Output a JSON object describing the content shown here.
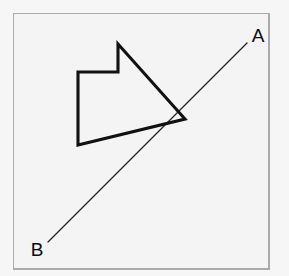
{
  "figure": {
    "background_color": "#f6f6f6",
    "grid": {
      "origin_x": 13,
      "origin_y": 13,
      "cell_size": 28.4,
      "columns": 9,
      "rows": 9,
      "line_color": "#b9b9bd",
      "border_color": "#a9a9ae",
      "fill_color": "#f4f4f4",
      "visible": true
    },
    "labels": [
      {
        "id": "A",
        "text": "A",
        "x": 258,
        "y": 42,
        "anchor": "middle"
      },
      {
        "id": "B",
        "text": "B",
        "x": 37,
        "y": 256,
        "anchor": "middle"
      }
    ],
    "line_ab": {
      "name": "line-ab",
      "color": "#222222",
      "stroke_width": 1.25,
      "start": {
        "point": "B",
        "x": 48,
        "y": 242
      },
      "end": {
        "point": "A",
        "x": 247,
        "y": 43
      }
    },
    "arrow_polygon": {
      "name": "arrow-polygon",
      "color": "#111111",
      "stroke_width": 3.1,
      "closed": true,
      "vertices": [
        {
          "x": 118,
          "y": 44
        },
        {
          "x": 118,
          "y": 72
        },
        {
          "x": 78,
          "y": 72
        },
        {
          "x": 78,
          "y": 145
        },
        {
          "x": 185,
          "y": 119
        }
      ],
      "points_string": "118,44 118,72 78,72 78,145 185,119"
    },
    "intersection_note": {
      "x": 185,
      "y": 119,
      "description": "arrow tip meets line AB"
    }
  }
}
